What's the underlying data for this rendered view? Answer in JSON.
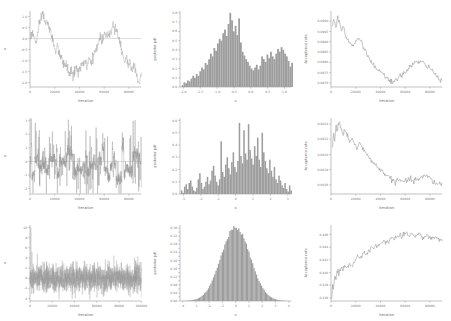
{
  "figure": {
    "title": "",
    "rows": 3,
    "cols": 3,
    "background": "#ffffff",
    "line_color": "#8d8d8d",
    "bar_color": "#9d9d9d"
  },
  "labels": {
    "iteration": "Iteration",
    "x": "x",
    "posterior_pdf": "posterior pdf",
    "acceptance_rate": "Acceptance rate"
  },
  "chart_data": [
    {
      "type": "line",
      "panel": "row1-trace",
      "title": "",
      "xlabel": "Iteration",
      "ylabel": "x",
      "xlim": [
        0,
        90000
      ],
      "ylim": [
        -2.2,
        1.25
      ],
      "xticks": [
        0,
        20000,
        40000,
        60000,
        80000
      ],
      "xticklabels": [
        "0",
        "20000",
        "40000",
        "60000",
        "80000"
      ],
      "yticks": [
        1.0,
        0.5,
        0.0,
        -0.5,
        -1.0,
        -1.5,
        -2.0
      ],
      "yticklabels": [
        "1.0",
        "0.5",
        "0.0",
        "-0.5",
        "-1.0",
        "-1.5",
        "-2.0"
      ],
      "grid": false,
      "reference_line_y": 0.0,
      "x": [
        0,
        1500,
        3000,
        4500,
        6000,
        7500,
        9000,
        10500,
        12000,
        13500,
        15000,
        16500,
        18000,
        19500,
        21000,
        22500,
        24000,
        25500,
        27000,
        28500,
        30000,
        31500,
        33000,
        34500,
        36000,
        37500,
        39000,
        40500,
        42000,
        43500,
        45000,
        46500,
        48000,
        49500,
        51000,
        52500,
        54000,
        55500,
        57000,
        58500,
        60000,
        61500,
        63000,
        64500,
        66000,
        67500,
        69000,
        70500,
        72000,
        73500,
        75000,
        76500,
        78000,
        79500,
        81000,
        82500,
        84000,
        85500,
        87000,
        88500,
        90000
      ],
      "values": [
        -0.05,
        0.25,
        0.12,
        -0.2,
        0.1,
        0.55,
        0.9,
        1.18,
        0.7,
        0.82,
        0.52,
        0.3,
        0.05,
        -0.3,
        -0.55,
        -0.42,
        -0.7,
        -0.95,
        -1.2,
        -1.05,
        -1.35,
        -1.6,
        -1.45,
        -1.72,
        -1.5,
        -1.3,
        -1.55,
        -1.35,
        -1.1,
        -1.3,
        -1.0,
        -1.25,
        -0.95,
        -1.15,
        -0.85,
        -0.6,
        -0.4,
        -0.15,
        0.1,
        -0.1,
        0.25,
        0.05,
        0.35,
        0.15,
        0.45,
        0.68,
        0.5,
        0.3,
        0.05,
        -0.3,
        -0.7,
        -1.1,
        -0.9,
        -1.25,
        -1.05,
        -1.4,
        -1.2,
        -1.55,
        -1.8,
        -2.0,
        -1.55
      ]
    },
    {
      "type": "bar",
      "panel": "row1-hist",
      "title": "",
      "xlabel": "x",
      "ylabel": "posterior pdf",
      "xlim": [
        -2.1,
        1.2
      ],
      "ylim": [
        0.0,
        0.82
      ],
      "xticks": [
        -2.0,
        -1.5,
        -1.0,
        -0.5,
        0.0,
        0.5,
        1.0
      ],
      "xticklabels": [
        "-2.0",
        "-1.5",
        "-1.0",
        "-0.5",
        "0.0",
        "0.5",
        "1.0"
      ],
      "yticks": [
        0.0,
        0.1,
        0.2,
        0.3,
        0.4,
        0.5,
        0.6,
        0.7,
        0.8
      ],
      "yticklabels": [
        "0.0",
        "0.1",
        "0.2",
        "0.3",
        "0.4",
        "0.5",
        "0.6",
        "0.7",
        "0.8"
      ],
      "grid": false,
      "bin_edges_start": -2.05,
      "bin_width": 0.0524,
      "values": [
        0.02,
        0.05,
        0.04,
        0.07,
        0.06,
        0.09,
        0.12,
        0.1,
        0.14,
        0.12,
        0.17,
        0.21,
        0.19,
        0.26,
        0.24,
        0.3,
        0.36,
        0.33,
        0.42,
        0.39,
        0.47,
        0.52,
        0.5,
        0.58,
        0.62,
        0.55,
        0.68,
        0.8,
        0.72,
        0.6,
        0.66,
        0.56,
        0.74,
        0.48,
        0.38,
        0.34,
        0.3,
        0.27,
        0.23,
        0.2,
        0.18,
        0.21,
        0.24,
        0.19,
        0.23,
        0.33,
        0.3,
        0.27,
        0.35,
        0.31,
        0.38,
        0.33,
        0.3,
        0.36,
        0.41,
        0.38,
        0.43,
        0.4,
        0.36,
        0.33,
        0.28,
        0.22,
        0.26,
        0.18,
        0.14,
        0.1,
        0.12,
        0.07,
        0.04,
        0.02,
        0.01,
        0.09,
        0.02
      ]
    },
    {
      "type": "line",
      "panel": "row1-acceptance",
      "title": "",
      "xlabel": "Iteration",
      "ylabel": "Acceptance rate",
      "xlim": [
        0,
        90000
      ],
      "ylim": [
        0.0868,
        0.0905
      ],
      "xticks": [
        0,
        20000,
        40000,
        60000,
        80000
      ],
      "xticklabels": [
        "0",
        "20000",
        "40000",
        "60000",
        "80000"
      ],
      "yticks": [
        0.09,
        0.0895,
        0.089,
        0.0885,
        0.088,
        0.0875,
        0.087
      ],
      "yticklabels": [
        "0.0900",
        "0.0895",
        "0.0890",
        "0.0885",
        "0.0880",
        "0.0875",
        "0.0870"
      ],
      "grid": false,
      "x": [
        1000,
        2500,
        4000,
        5500,
        7000,
        8500,
        10000,
        12000,
        14000,
        16000,
        18000,
        20000,
        22000,
        24000,
        26000,
        28000,
        30000,
        32000,
        34000,
        36000,
        38000,
        40000,
        42000,
        44000,
        46000,
        48000,
        50000,
        52000,
        54000,
        56000,
        58000,
        60000,
        62000,
        64000,
        66000,
        68000,
        70000,
        72000,
        74000,
        76000,
        78000,
        80000,
        82000,
        84000,
        86000,
        88000,
        90000
      ],
      "values": [
        0.0898,
        0.0901,
        0.0897,
        0.0902,
        0.0899,
        0.0896,
        0.0898,
        0.0893,
        0.0891,
        0.0889,
        0.0888,
        0.089,
        0.0892,
        0.0891,
        0.0888,
        0.0885,
        0.0883,
        0.0881,
        0.0879,
        0.0877,
        0.0876,
        0.0875,
        0.0874,
        0.0873,
        0.0872,
        0.0871,
        0.087,
        0.0871,
        0.0872,
        0.0873,
        0.0874,
        0.0875,
        0.0877,
        0.0878,
        0.0879,
        0.088,
        0.088,
        0.088,
        0.088,
        0.0879,
        0.0878,
        0.0877,
        0.0876,
        0.0874,
        0.0873,
        0.0872,
        0.0871
      ]
    },
    {
      "type": "line",
      "panel": "row2-trace",
      "title": "",
      "xlabel": "Iteration",
      "ylabel": "x",
      "xlim": [
        0,
        90000
      ],
      "ylim": [
        -2.4,
        3.2
      ],
      "xticks": [
        0,
        20000,
        40000,
        60000,
        80000
      ],
      "xticklabels": [
        "0",
        "20000",
        "40000",
        "60000",
        "80000"
      ],
      "yticks": [
        3,
        2,
        1,
        0,
        -1,
        -2
      ],
      "yticklabels": [
        "3",
        "2",
        "1",
        "0",
        "-1",
        "-2"
      ],
      "grid": false,
      "reference_line_y": 0.0,
      "description": "spiky poorly-mixing chain with long vertical excursions between -2 and 3"
    },
    {
      "type": "bar",
      "panel": "row2-hist",
      "title": "",
      "xlabel": "x",
      "ylabel": "posterior pdf",
      "xlim": [
        -3.2,
        3.2
      ],
      "ylim": [
        0.0,
        0.62
      ],
      "xticks": [
        -3,
        -2,
        -1,
        0,
        1,
        2,
        3
      ],
      "xticklabels": [
        "-3",
        "-2",
        "-1",
        "0",
        "1",
        "2",
        "3"
      ],
      "yticks": [
        0.0,
        0.1,
        0.2,
        0.3,
        0.4,
        0.5,
        0.6
      ],
      "yticklabels": [
        "0.0",
        "0.1",
        "0.2",
        "0.3",
        "0.4",
        "0.5",
        "0.6"
      ],
      "grid": false,
      "bin_edges_start": -3.15,
      "bin_width": 0.0875,
      "values": [
        0.03,
        0.01,
        0.06,
        0.08,
        0.04,
        0.09,
        0.11,
        0.06,
        0.03,
        0.02,
        0.05,
        0.12,
        0.17,
        0.09,
        0.04,
        0.06,
        0.1,
        0.14,
        0.08,
        0.11,
        0.19,
        0.23,
        0.15,
        0.1,
        0.07,
        0.12,
        0.43,
        0.18,
        0.14,
        0.24,
        0.3,
        0.21,
        0.16,
        0.26,
        0.34,
        0.22,
        0.18,
        0.27,
        0.58,
        0.31,
        0.25,
        0.52,
        0.33,
        0.28,
        0.57,
        0.36,
        0.29,
        0.24,
        0.39,
        0.31,
        0.46,
        0.28,
        0.22,
        0.5,
        0.34,
        0.27,
        0.21,
        0.17,
        0.28,
        0.19,
        0.14,
        0.22,
        0.12,
        0.09,
        0.15,
        0.11,
        0.07,
        0.05,
        0.09,
        0.04,
        0.02,
        0.07,
        0.03,
        0.05,
        0.01,
        0.08,
        0.02
      ]
    },
    {
      "type": "line",
      "panel": "row2-acceptance",
      "title": "",
      "xlabel": "Iteration",
      "ylabel": "Acceptance rate",
      "xlim": [
        0,
        90000
      ],
      "ylim": [
        0.00148,
        0.00248
      ],
      "xticks": [
        0,
        20000,
        40000,
        60000,
        80000
      ],
      "xticklabels": [
        "0",
        "20000",
        "40000",
        "60000",
        "80000"
      ],
      "yticks": [
        0.0024,
        0.0022,
        0.002,
        0.0018,
        0.0016
      ],
      "yticklabels": [
        "0.0024",
        "0.0022",
        "0.0020",
        "0.0018",
        "0.0016"
      ],
      "grid": false,
      "x": [
        1000,
        2000,
        3000,
        4000,
        5000,
        6500,
        8000,
        9500,
        11000,
        13000,
        15000,
        17000,
        19000,
        21000,
        23000,
        25000,
        27000,
        29000,
        31000,
        33000,
        35000,
        37000,
        39000,
        41000,
        43000,
        45000,
        47000,
        49000,
        51000,
        53000,
        55000,
        57000,
        59000,
        61000,
        63000,
        65000,
        67000,
        69000,
        71000,
        73000,
        75000,
        77000,
        79000,
        81000,
        83000,
        85000,
        87000,
        89000,
        90000
      ],
      "values": [
        0.00208,
        0.00228,
        0.00219,
        0.0024,
        0.00231,
        0.00243,
        0.00234,
        0.00226,
        0.00232,
        0.00224,
        0.00218,
        0.00222,
        0.00213,
        0.00208,
        0.00216,
        0.0021,
        0.00204,
        0.00199,
        0.00196,
        0.00192,
        0.00188,
        0.00184,
        0.00181,
        0.00178,
        0.00176,
        0.00173,
        0.0017,
        0.00167,
        0.00165,
        0.00164,
        0.00166,
        0.00165,
        0.00164,
        0.00166,
        0.00167,
        0.00166,
        0.00165,
        0.00167,
        0.00168,
        0.00169,
        0.00171,
        0.00172,
        0.0017,
        0.00167,
        0.00164,
        0.00161,
        0.00163,
        0.0016,
        0.00162
      ]
    },
    {
      "type": "line",
      "panel": "row3-trace",
      "title": "",
      "xlabel": "Iteration",
      "ylabel": "x",
      "xlim": [
        0,
        100000
      ],
      "ylim": [
        -4.5,
        10.5
      ],
      "xticks": [
        0,
        20000,
        40000,
        60000,
        80000,
        100000
      ],
      "xticklabels": [
        "0",
        "20000",
        "40000",
        "60000",
        "80000",
        "100000"
      ],
      "yticks": [
        10,
        8,
        6,
        4,
        2,
        0,
        -2,
        -4
      ],
      "yticklabels": [
        "10",
        "8",
        "6",
        "4",
        "2",
        "0",
        "-2",
        "-4"
      ],
      "grid": false,
      "reference_line_y": 0.0,
      "description": "well-mixed dense band roughly between -3.5 and 3.5 with one early spike near 10"
    },
    {
      "type": "bar",
      "panel": "row3-hist",
      "title": "",
      "xlabel": "x",
      "ylabel": "posterior pdf",
      "xlim": [
        -4.2,
        4.2
      ],
      "ylim": [
        0.0,
        0.375
      ],
      "xticks": [
        -4,
        -3,
        -2,
        -1,
        0,
        1,
        2,
        3,
        4
      ],
      "xticklabels": [
        "-4",
        "-3",
        "-2",
        "-1",
        "0",
        "1",
        "2",
        "3",
        "4"
      ],
      "yticks": [
        0.0,
        0.02,
        0.04,
        0.06,
        0.08,
        0.1,
        0.12,
        0.14,
        0.16,
        0.18,
        0.2,
        0.22,
        0.24,
        0.26,
        0.28,
        0.3,
        0.32,
        0.34,
        0.36
      ],
      "yticklabels": [
        "0.00",
        "0.02",
        "0.04",
        "0.06",
        "0.08",
        "0.10",
        "0.12",
        "0.14",
        "0.16",
        "0.18",
        "0.20",
        "0.22",
        "0.24",
        "0.26",
        "0.28",
        "0.30",
        "0.32",
        "0.34",
        "0.36"
      ],
      "grid": false,
      "distribution": "gaussian",
      "mean": 0.0,
      "sigma": 1.1,
      "peak": 0.362,
      "n_bins": 88
    },
    {
      "type": "line",
      "panel": "row3-acceptance",
      "title": "",
      "xlabel": "Iteration",
      "ylabel": "Acceptance rate",
      "xlim": [
        0,
        90000
      ],
      "ylim": [
        0.4355,
        0.4475
      ],
      "xticks": [
        0,
        20000,
        40000,
        60000,
        80000
      ],
      "xticklabels": [
        "0",
        "20000",
        "40000",
        "60000",
        "80000"
      ],
      "yticks": [
        0.446,
        0.444,
        0.442,
        0.44,
        0.438,
        0.436
      ],
      "yticklabels": [
        "0.446",
        "0.444",
        "0.442",
        "0.440",
        "0.438",
        "0.436"
      ],
      "grid": false,
      "x": [
        500,
        1200,
        2000,
        3000,
        4000,
        5000,
        6500,
        8000,
        9500,
        11000,
        13000,
        15000,
        17000,
        19000,
        21000,
        23000,
        25000,
        27000,
        29000,
        31000,
        33000,
        35000,
        37000,
        39000,
        41000,
        43000,
        45000,
        47000,
        49000,
        51000,
        53000,
        55000,
        57000,
        59000,
        61000,
        63000,
        65000,
        67000,
        69000,
        71000,
        73000,
        75000,
        77000,
        79000,
        81000,
        83000,
        85000,
        87000,
        89000,
        90000
      ],
      "values": [
        0.436,
        0.4378,
        0.4372,
        0.4395,
        0.4388,
        0.4405,
        0.4398,
        0.4408,
        0.4402,
        0.4412,
        0.4406,
        0.4415,
        0.441,
        0.4418,
        0.4424,
        0.442,
        0.4428,
        0.4432,
        0.443,
        0.4436,
        0.444,
        0.4438,
        0.4444,
        0.4442,
        0.4447,
        0.445,
        0.4448,
        0.4452,
        0.4455,
        0.4453,
        0.4456,
        0.4458,
        0.4455,
        0.4459,
        0.4461,
        0.4458,
        0.4462,
        0.446,
        0.4457,
        0.4461,
        0.4458,
        0.4455,
        0.4459,
        0.4456,
        0.4453,
        0.4456,
        0.4454,
        0.4451,
        0.4453,
        0.4452
      ]
    }
  ]
}
